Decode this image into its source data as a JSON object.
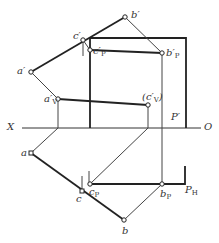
{
  "diagram": {
    "type": "descriptive-geometry-projection",
    "colors": {
      "line": "#222222",
      "thin_line": "#444444",
      "text": "#333333",
      "background": "#ffffff"
    },
    "axis": {
      "left_label": "X",
      "right_label": "O"
    },
    "frontal_view": {
      "points": [
        {
          "id": "a_prime",
          "label": "a′"
        },
        {
          "id": "b_prime",
          "label": "b′"
        },
        {
          "id": "c_prime",
          "label": "c′"
        },
        {
          "id": "cp_prime",
          "label": "c′",
          "sub": "P"
        },
        {
          "id": "bp_prime",
          "label": "b′",
          "sub": "P"
        },
        {
          "id": "av_prime",
          "label": "a′",
          "sub": "V"
        },
        {
          "id": "cv_prime",
          "label": "(c′",
          "sub": "V",
          "suffix": ")"
        }
      ],
      "plane_label": "P′"
    },
    "horizontal_view": {
      "points": [
        {
          "id": "a",
          "label": "a"
        },
        {
          "id": "b",
          "label": "b"
        },
        {
          "id": "c",
          "label": "c"
        },
        {
          "id": "cp",
          "label": "c",
          "sub": "P"
        },
        {
          "id": "bp",
          "label": "b",
          "sub": "P"
        }
      ],
      "plane_label": "P",
      "plane_sub": "H"
    }
  }
}
